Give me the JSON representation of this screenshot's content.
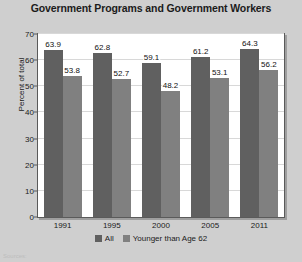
{
  "chart_data": {
    "type": "bar",
    "title": "Government Programs and Government Workers",
    "xlabel": "",
    "ylabel": "Percent of total",
    "categories": [
      "1991",
      "1995",
      "2000",
      "2005",
      "2011"
    ],
    "series": [
      {
        "name": "All",
        "values": [
          63.9,
          62.8,
          59.1,
          61.2,
          64.3
        ],
        "color": "#606060"
      },
      {
        "name": "Younger than Age 62",
        "values": [
          53.8,
          52.7,
          48.2,
          53.1,
          56.2
        ],
        "color": "#808080"
      }
    ],
    "ylim": [
      0,
      70
    ],
    "yticks": [
      0,
      10,
      20,
      30,
      40,
      50,
      60,
      70
    ],
    "ytick_labels": [
      "0",
      "10",
      "20",
      "30",
      "40",
      "50",
      "60",
      "70"
    ],
    "grid": true,
    "legend_position": "bottom"
  },
  "footnote": "Sources:"
}
